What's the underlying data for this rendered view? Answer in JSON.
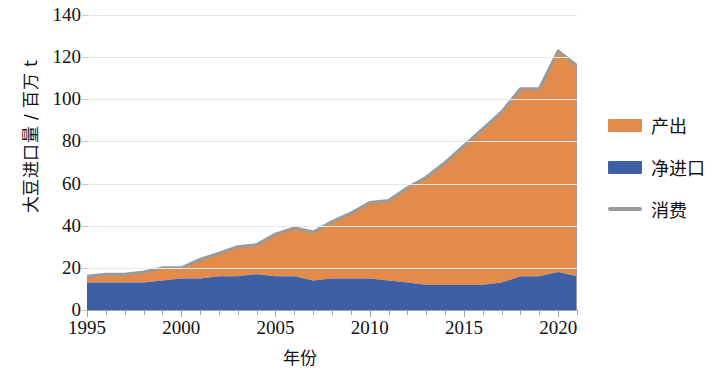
{
  "chart_data": {
    "type": "area",
    "title": "",
    "xlabel": "年份",
    "ylabel": "大豆进口量 / 百万 t",
    "x": [
      1995,
      1996,
      1997,
      1998,
      1999,
      2000,
      2001,
      2002,
      2003,
      2004,
      2005,
      2006,
      2007,
      2008,
      2009,
      2010,
      2011,
      2012,
      2013,
      2014,
      2015,
      2016,
      2017,
      2018,
      2019,
      2020,
      2021
    ],
    "xlim": [
      1995,
      2021
    ],
    "ylim": [
      0,
      140
    ],
    "yticks": [
      0,
      20,
      40,
      60,
      80,
      100,
      120,
      140
    ],
    "xticks": [
      1995,
      2000,
      2005,
      2010,
      2015,
      2020
    ],
    "grid": true,
    "legend_position": "right",
    "stacked": true,
    "series": [
      {
        "name": "净进口",
        "key": "net_import",
        "color": "#3F5FA4",
        "type": "area",
        "values": [
          13,
          13,
          13,
          13,
          14,
          15,
          15,
          16,
          16,
          17,
          16,
          16,
          14,
          15,
          15,
          15,
          14,
          13,
          12,
          12,
          12,
          12,
          13,
          16,
          16,
          18,
          16
        ]
      },
      {
        "name": "产出",
        "key": "output",
        "color": "#E28B4A",
        "type": "area",
        "values": [
          3,
          4,
          4,
          5,
          6,
          5,
          9,
          11,
          14,
          14,
          20,
          23,
          23,
          27,
          31,
          36,
          38,
          45,
          51,
          58,
          66,
          74,
          81,
          89,
          89,
          105,
          100
        ]
      },
      {
        "name": "消费",
        "key": "consumption",
        "color": "#9a9a9a",
        "type": "line",
        "values": [
          16,
          17,
          17,
          18,
          20,
          20,
          24,
          27,
          30,
          31,
          36,
          39,
          37,
          42,
          46,
          51,
          52,
          58,
          63,
          70,
          78,
          86,
          94,
          105,
          105,
          123,
          116
        ]
      }
    ]
  },
  "yaxis": {
    "ticks": [
      "140",
      "120",
      "100",
      "80",
      "60",
      "40",
      "20",
      "0"
    ]
  },
  "xaxis": {
    "ticks": [
      "1995",
      "2000",
      "2005",
      "2010",
      "2015",
      "2020"
    ]
  },
  "legend": {
    "items": [
      {
        "label": "产出",
        "color": "#E28B4A",
        "marker": "box"
      },
      {
        "label": "净进口",
        "color": "#3F5FA4",
        "marker": "box"
      },
      {
        "label": "消费",
        "color": "#9a9a9a",
        "marker": "line"
      }
    ]
  }
}
